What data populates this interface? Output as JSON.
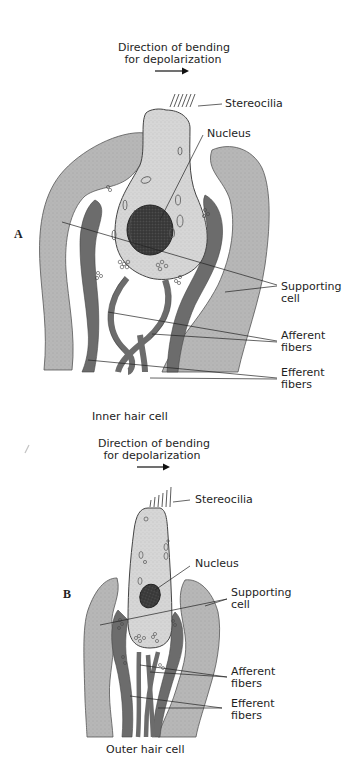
{
  "figure": {
    "panels": [
      {
        "letter": "A",
        "direction_label_line1": "Direction of bending",
        "direction_label_line2": "for depolarization",
        "caption": "Inner hair cell",
        "labels": {
          "stereocilia": "Stereocilia",
          "nucleus": "Nucleus",
          "supporting_line1": "Supporting",
          "supporting_line2": "cell",
          "afferent_line1": "Afferent",
          "afferent_line2": "fibers",
          "efferent_line1": "Efferent",
          "efferent_line2": "fibers"
        }
      },
      {
        "letter": "B",
        "direction_label_line1": "Direction of bending",
        "direction_label_line2": "for depolarization",
        "caption": "Outer hair cell",
        "labels": {
          "stereocilia": "Stereocilia",
          "nucleus": "Nucleus",
          "supporting_line1": "Supporting",
          "supporting_line2": "cell",
          "afferent_line1": "Afferent",
          "afferent_line2": "fibers",
          "efferent_line1": "Efferent",
          "efferent_line2": "fibers"
        }
      }
    ],
    "colors": {
      "supporting_cell": "#b4b4b4",
      "hair_cell": "#d2d2d2",
      "nerve_fiber": "#6e6e6e",
      "nucleus": "#3c3c3c",
      "outline": "#444444",
      "background": "#ffffff"
    }
  }
}
